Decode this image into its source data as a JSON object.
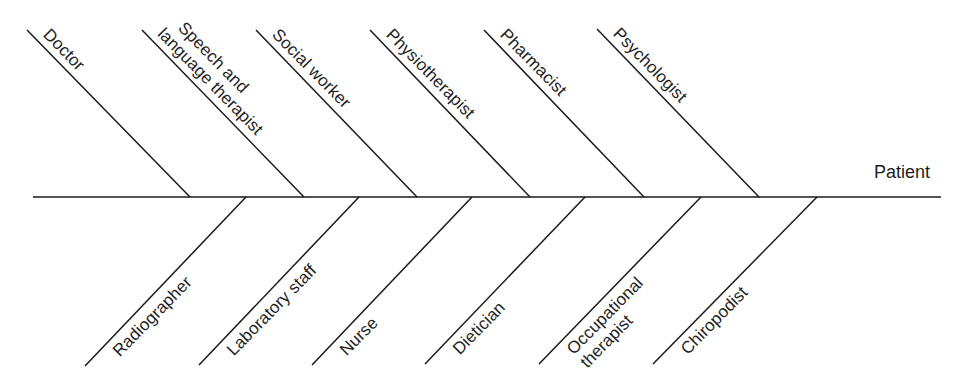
{
  "diagram": {
    "type": "fishbone",
    "head_label": "Patient",
    "line_color": "#1a1a1a",
    "text_color": "#1e1e1e",
    "spine": {
      "x1": 33,
      "y1": 197,
      "x2": 941,
      "y2": 197
    },
    "upper_bones": [
      {
        "label_lines": [
          "Doctor"
        ],
        "x1": 27,
        "y1": 30,
        "x2": 190,
        "y2": 197
      },
      {
        "label_lines": [
          "Speech and",
          "language therapist"
        ],
        "x1": 142,
        "y1": 30,
        "x2": 304,
        "y2": 197
      },
      {
        "label_lines": [
          "Social worker"
        ],
        "x1": 256,
        "y1": 30,
        "x2": 417,
        "y2": 197
      },
      {
        "label_lines": [
          "Physiotherapist"
        ],
        "x1": 370,
        "y1": 30,
        "x2": 530,
        "y2": 197
      },
      {
        "label_lines": [
          "Pharmacist"
        ],
        "x1": 484,
        "y1": 30,
        "x2": 644,
        "y2": 197
      },
      {
        "label_lines": [
          "Psychologist"
        ],
        "x1": 597,
        "y1": 29,
        "x2": 759,
        "y2": 197
      }
    ],
    "lower_bones": [
      {
        "label_lines": [
          "Radiographer"
        ],
        "x1": 246,
        "y1": 197,
        "x2": 85,
        "y2": 366
      },
      {
        "label_lines": [
          "Laboratory staff"
        ],
        "x1": 359,
        "y1": 197,
        "x2": 199,
        "y2": 365
      },
      {
        "label_lines": [
          "Nurse"
        ],
        "x1": 472,
        "y1": 197,
        "x2": 312,
        "y2": 365
      },
      {
        "label_lines": [
          "Dietician"
        ],
        "x1": 585,
        "y1": 197,
        "x2": 425,
        "y2": 364
      },
      {
        "label_lines": [
          "Occupational",
          "therapist"
        ],
        "x1": 701,
        "y1": 197,
        "x2": 539,
        "y2": 364
      },
      {
        "label_lines": [
          "Chiropodist"
        ],
        "x1": 817,
        "y1": 197,
        "x2": 653,
        "y2": 364
      }
    ]
  }
}
